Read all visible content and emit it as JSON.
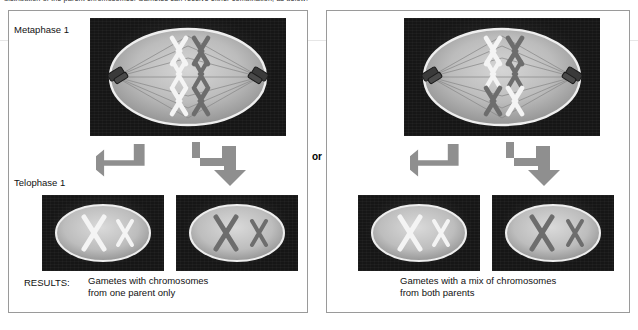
{
  "figure": {
    "top_caption": "distribution of the parent chromosomes. Gametes can receive either combination, as below:",
    "or_separator": "or",
    "colors": {
      "panel_border": "#9a9a9a",
      "micrograph_background": "#161616",
      "cell_cytoplasm": "#b9b9b9",
      "chromosome_light": "#f2f2f2",
      "chromosome_dark": "#6d6d6d",
      "arrow_gray": "#8f8f8f",
      "page_background": "#ffffff",
      "text": "#111111"
    }
  },
  "rows": {
    "metaphase_label": "Metaphase 1",
    "telophase_label": "Telophase 1",
    "results_label": "RESULTS:"
  },
  "panels": [
    {
      "id": "left",
      "caption": "Gametes with chromosomes\nfrom one parent only",
      "metaphase": {
        "name": "metaphase-1-cell-left",
        "chromosome_rows": [
          {
            "left": "light",
            "right": "dark"
          },
          {
            "left": "light",
            "right": "dark"
          },
          {
            "left": "light",
            "right": "dark"
          }
        ],
        "centriole_count": 2,
        "spindle_fiber_count": 14
      },
      "gametes": [
        {
          "name": "gamete-left-a",
          "chromosomes": [
            "light",
            "light"
          ]
        },
        {
          "name": "gamete-left-b",
          "chromosomes": [
            "dark",
            "dark"
          ]
        }
      ]
    },
    {
      "id": "right",
      "caption": "Gametes with a mix of chromosomes\nfrom both parents",
      "metaphase": {
        "name": "metaphase-1-cell-right",
        "chromosome_rows": [
          {
            "left": "light",
            "right": "dark"
          },
          {
            "left": "light",
            "right": "dark"
          },
          {
            "left": "dark",
            "right": "light"
          }
        ],
        "centriole_count": 2,
        "spindle_fiber_count": 14
      },
      "gametes": [
        {
          "name": "gamete-right-a",
          "chromosomes": [
            "light",
            "light"
          ]
        },
        {
          "name": "gamete-right-b",
          "chromosomes": [
            "dark",
            "dark"
          ]
        }
      ]
    }
  ]
}
